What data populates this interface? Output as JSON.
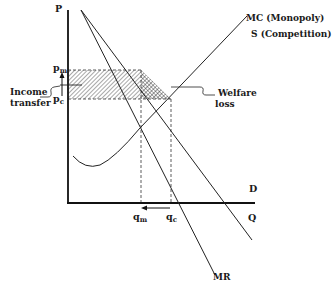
{
  "diagram": {
    "axes": {
      "y_label": "P",
      "x_label": "Q"
    },
    "curves": {
      "mc_label": "MC (Monopoly)",
      "s_label": "S (Competition)",
      "demand_label": "D",
      "mr_label": "MR"
    },
    "prices": {
      "pm": "p",
      "pm_sub": "m",
      "pc": "p",
      "pc_sub": "c"
    },
    "quantities": {
      "qm": "q",
      "qm_sub": "m",
      "qc": "q",
      "qc_sub": "c"
    },
    "annotations": {
      "income_transfer_line1": "Income",
      "income_transfer_line2": "transfer",
      "welfare_loss_line1": "Welfare",
      "welfare_loss_line2": "loss"
    },
    "colors": {
      "ink": "#1a1a1a",
      "background": "#ffffff"
    }
  }
}
